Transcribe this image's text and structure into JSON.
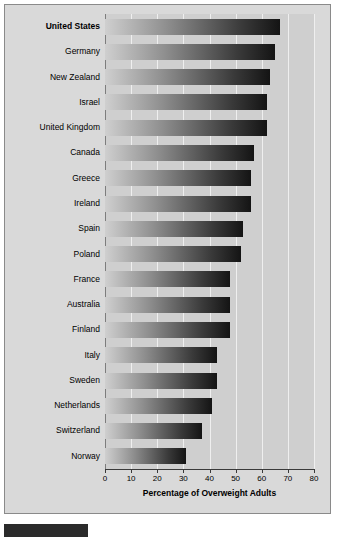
{
  "chart_data": {
    "type": "bar",
    "orientation": "horizontal",
    "title": "",
    "xlabel": "Percentage of Overweight Adults",
    "ylabel": "",
    "xlim": [
      0,
      80
    ],
    "xticks": [
      0,
      10,
      20,
      30,
      40,
      50,
      60,
      70,
      80
    ],
    "grid": "vertical",
    "legend": "none",
    "categories": [
      "United States",
      "Germany",
      "New Zealand",
      "Israel",
      "United Kingdom",
      "Canada",
      "Greece",
      "Ireland",
      "Spain",
      "Poland",
      "France",
      "Australia",
      "Finland",
      "Italy",
      "Sweden",
      "Netherlands",
      "Switzerland",
      "Norway"
    ],
    "values": [
      67,
      65,
      63,
      62,
      62,
      57,
      56,
      56,
      53,
      52,
      48,
      48,
      48,
      43,
      43,
      41,
      37,
      31
    ],
    "highlighted_category": "United States"
  },
  "axis": {
    "title": "Percentage of Overweight Adults",
    "ticks": [
      "0",
      "10",
      "20",
      "30",
      "40",
      "50",
      "60",
      "70",
      "80"
    ]
  },
  "caption": {
    "text": ""
  }
}
